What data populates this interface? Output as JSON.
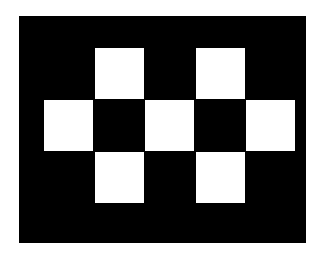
{
  "canvas": {
    "background": "#ffffff",
    "board": {
      "x": 19,
      "y": 16,
      "width": 287,
      "height": 227,
      "color": "#000000"
    }
  },
  "pattern": {
    "cell_color": "#ffffff",
    "cell_size": {
      "width": 49,
      "height": 51
    },
    "cells": [
      {
        "name": "top-left-square",
        "x": 95,
        "y": 48
      },
      {
        "name": "top-right-square",
        "x": 196,
        "y": 48
      },
      {
        "name": "middle-left-square",
        "x": 44,
        "y": 100
      },
      {
        "name": "middle-center-square",
        "x": 145,
        "y": 100
      },
      {
        "name": "middle-right-square",
        "x": 246,
        "y": 100
      },
      {
        "name": "bottom-left-square",
        "x": 95,
        "y": 152
      },
      {
        "name": "bottom-right-square",
        "x": 196,
        "y": 152
      }
    ]
  }
}
